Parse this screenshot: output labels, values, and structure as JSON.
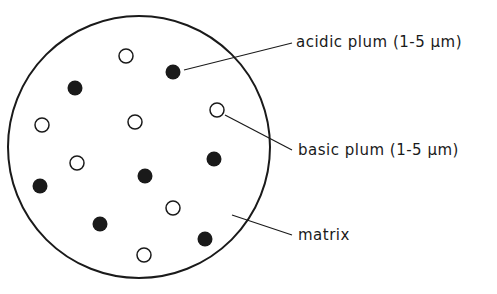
{
  "diagram": {
    "container": {
      "shape": "circle",
      "cx": 139,
      "cy": 147,
      "r": 131
    },
    "particles": {
      "open": [
        [
          126,
          56
        ],
        [
          42,
          125
        ],
        [
          135,
          122
        ],
        [
          77,
          163
        ],
        [
          173,
          208
        ],
        [
          144,
          255
        ],
        [
          217,
          110
        ]
      ],
      "filled": [
        [
          173,
          72
        ],
        [
          75,
          88
        ],
        [
          40,
          186
        ],
        [
          145,
          176
        ],
        [
          214,
          159
        ],
        [
          100,
          224
        ],
        [
          205,
          239
        ]
      ],
      "radius": 7
    },
    "labels": {
      "acidic": "acidic plum (1-5 μm)",
      "basic": "basic plum (1-5 μm)",
      "matrix": "matrix"
    },
    "colors": {
      "line": "#1a1a1a",
      "background": "#ffffff"
    }
  }
}
